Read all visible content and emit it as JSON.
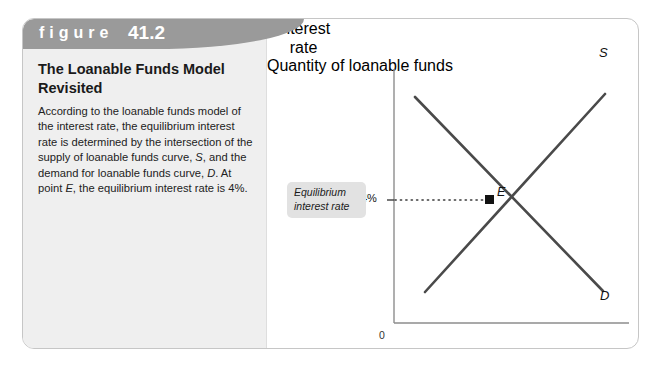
{
  "figure": {
    "header_label": "figure",
    "header_number": "41.2",
    "title": "The Loanable Funds Model Revisited",
    "caption": "According to the loanable funds model of the interest rate, the equilibrium interest rate is determined by the intersection of the supply of loanable funds curve, S, and the demand for loanable funds curve, D. At point E, the equilibrium interest rate is 4%."
  },
  "chart_data": {
    "type": "line",
    "title": "The Loanable Funds Model Revisited",
    "xlabel": "Quantity of loanable funds",
    "ylabel": "Interest rate",
    "origin_label": "0",
    "grid": false,
    "legend": "inline-curve-labels",
    "annotations": [
      {
        "name": "equilibrium-callout",
        "text": "Equilibrium interest rate",
        "style": "italic-gray-box"
      },
      {
        "name": "equilibrium-rate-tick",
        "text": "4%",
        "axis": "y",
        "value": 4
      },
      {
        "name": "equilibrium-point",
        "text": "E",
        "marker": "filled-square"
      },
      {
        "name": "equilibrium-dotted-line",
        "text": "",
        "style": "dotted-horizontal"
      }
    ],
    "series": [
      {
        "name": "S",
        "label": "S",
        "description": "supply of loanable funds, upward sloping",
        "slope": "positive",
        "points": [
          [
            0.16,
            0.12
          ],
          [
            0.86,
            0.93
          ]
        ]
      },
      {
        "name": "D",
        "label": "D",
        "description": "demand for loanable funds, downward sloping",
        "slope": "negative",
        "points": [
          [
            0.09,
            0.91
          ],
          [
            0.88,
            0.1
          ]
        ]
      }
    ],
    "equilibrium": {
      "interest_rate": "4%",
      "point_label": "E",
      "x_fraction": 0.4,
      "y_value": 4
    },
    "ylim": [
      0,
      10
    ],
    "xlim": [
      0,
      10
    ]
  },
  "colors": {
    "header_band": "#9a9a9a",
    "left_panel": "#efefef",
    "curve": "#4a4a4a",
    "callout_bg": "#e2e2e2",
    "frame_border": "#c6c6c6"
  }
}
